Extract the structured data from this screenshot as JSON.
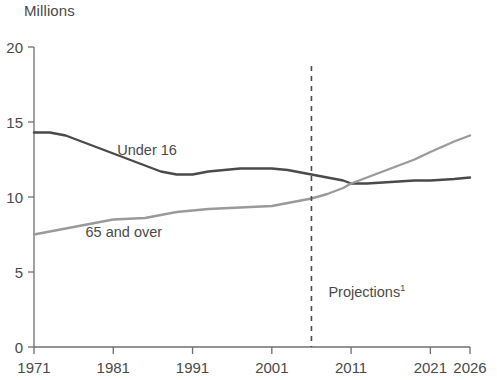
{
  "chart_data": {
    "type": "line",
    "title": "",
    "ylabel": "Millions",
    "xlabel": "",
    "ylim": [
      0,
      20
    ],
    "xlim": [
      1971,
      2026
    ],
    "yticks": [
      0,
      5,
      10,
      15,
      20
    ],
    "ytick_labels": [
      "0",
      "5",
      "10",
      "15",
      "20"
    ],
    "xticks": [
      1971,
      1981,
      1991,
      2001,
      2011,
      2021,
      2026
    ],
    "xtick_labels": [
      "1971",
      "1981",
      "1991",
      "2001",
      "2011",
      "2021",
      "2026"
    ],
    "grid": false,
    "legend_position": "inline-labels",
    "annotations": [
      {
        "name": "projections-divider",
        "text": "Projections",
        "superscript": "1",
        "x": 2006,
        "style": "dashed-vertical-line"
      }
    ],
    "series": [
      {
        "name": "Under 16",
        "color": "#4a4a4a",
        "label_x": 1981.5,
        "label_y": 13.1,
        "x": [
          1971,
          1973,
          1975,
          1977,
          1979,
          1981,
          1983,
          1985,
          1987,
          1989,
          1991,
          1993,
          1995,
          1997,
          1999,
          2001,
          2003,
          2005,
          2006,
          2008,
          2010,
          2011,
          2013,
          2016,
          2019,
          2021,
          2024,
          2026
        ],
        "values": [
          14.3,
          14.3,
          14.1,
          13.7,
          13.3,
          12.9,
          12.5,
          12.1,
          11.7,
          11.5,
          11.5,
          11.7,
          11.8,
          11.9,
          11.9,
          11.9,
          11.8,
          11.6,
          11.5,
          11.3,
          11.1,
          10.9,
          10.9,
          11.0,
          11.1,
          11.1,
          11.2,
          11.3
        ]
      },
      {
        "name": "65 and over",
        "color": "#9a9a9a",
        "label_x": 1977.5,
        "label_y": 7.6,
        "x": [
          1971,
          1973,
          1975,
          1977,
          1979,
          1981,
          1983,
          1985,
          1987,
          1989,
          1991,
          1993,
          1995,
          1997,
          1999,
          2001,
          2003,
          2005,
          2006,
          2008,
          2010,
          2011,
          2013,
          2016,
          2019,
          2021,
          2024,
          2026
        ],
        "values": [
          7.5,
          7.7,
          7.9,
          8.1,
          8.3,
          8.5,
          8.55,
          8.6,
          8.8,
          9.0,
          9.1,
          9.2,
          9.25,
          9.3,
          9.35,
          9.4,
          9.6,
          9.8,
          9.9,
          10.2,
          10.6,
          10.9,
          11.3,
          11.9,
          12.5,
          13.0,
          13.7,
          14.1
        ]
      }
    ]
  }
}
